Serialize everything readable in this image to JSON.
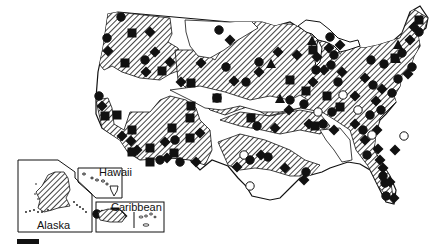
{
  "map": {
    "insets": {
      "alaska": {
        "label": "Alaska"
      },
      "hawaii": {
        "label": "Hawaii"
      },
      "caribbean": {
        "label": "Caribbean"
      }
    },
    "colors": {
      "ink": "#111111",
      "background": "#ffffff",
      "open_marker_fill": "#ffffff"
    },
    "hatch_pattern": "diagonal-lines",
    "marker_types": [
      "filled-circle",
      "filled-square",
      "filled-diamond",
      "filled-triangle",
      "open-circle"
    ],
    "markers": [
      {
        "t": "c",
        "x": 121,
        "y": 17
      },
      {
        "t": "s",
        "x": 132,
        "y": 33
      },
      {
        "t": "d",
        "x": 150,
        "y": 32
      },
      {
        "t": "c",
        "x": 107,
        "y": 38
      },
      {
        "t": "d",
        "x": 108,
        "y": 51
      },
      {
        "t": "d",
        "x": 155,
        "y": 52
      },
      {
        "t": "c",
        "x": 145,
        "y": 60
      },
      {
        "t": "s",
        "x": 125,
        "y": 63
      },
      {
        "t": "d",
        "x": 170,
        "y": 62
      },
      {
        "t": "s",
        "x": 162,
        "y": 71
      },
      {
        "t": "d",
        "x": 146,
        "y": 72
      },
      {
        "t": "d",
        "x": 201,
        "y": 63
      },
      {
        "t": "s",
        "x": 191,
        "y": 83
      },
      {
        "t": "d",
        "x": 181,
        "y": 82
      },
      {
        "t": "c",
        "x": 217,
        "y": 98
      },
      {
        "t": "s",
        "x": 217,
        "y": 98
      },
      {
        "t": "c",
        "x": 99,
        "y": 96
      },
      {
        "t": "d",
        "x": 102,
        "y": 106
      },
      {
        "t": "s",
        "x": 105,
        "y": 116
      },
      {
        "t": "s",
        "x": 117,
        "y": 115
      },
      {
        "t": "s",
        "x": 191,
        "y": 106
      },
      {
        "t": "s",
        "x": 190,
        "y": 118
      },
      {
        "t": "d",
        "x": 122,
        "y": 136
      },
      {
        "t": "s",
        "x": 132,
        "y": 130
      },
      {
        "t": "d",
        "x": 131,
        "y": 141
      },
      {
        "t": "s",
        "x": 132,
        "y": 152
      },
      {
        "t": "d",
        "x": 137,
        "y": 150
      },
      {
        "t": "s",
        "x": 150,
        "y": 148
      },
      {
        "t": "d",
        "x": 165,
        "y": 142
      },
      {
        "t": "s",
        "x": 172,
        "y": 128
      },
      {
        "t": "c",
        "x": 175,
        "y": 140
      },
      {
        "t": "d",
        "x": 167,
        "y": 158
      },
      {
        "t": "s",
        "x": 174,
        "y": 153
      },
      {
        "t": "c",
        "x": 180,
        "y": 162
      },
      {
        "t": "d",
        "x": 196,
        "y": 162
      },
      {
        "t": "d",
        "x": 200,
        "y": 133
      },
      {
        "t": "s",
        "x": 190,
        "y": 138
      },
      {
        "t": "s",
        "x": 150,
        "y": 162
      },
      {
        "t": "c",
        "x": 160,
        "y": 160
      },
      {
        "t": "c",
        "x": 226,
        "y": 67
      },
      {
        "t": "d",
        "x": 278,
        "y": 52
      },
      {
        "t": "d",
        "x": 297,
        "y": 55
      },
      {
        "t": "c",
        "x": 259,
        "y": 62
      },
      {
        "t": "tr",
        "x": 271,
        "y": 64
      },
      {
        "t": "d",
        "x": 259,
        "y": 72
      },
      {
        "t": "c",
        "x": 246,
        "y": 82
      },
      {
        "t": "d",
        "x": 234,
        "y": 81
      },
      {
        "t": "s",
        "x": 290,
        "y": 80
      },
      {
        "t": "d",
        "x": 313,
        "y": 82
      },
      {
        "t": "s",
        "x": 306,
        "y": 91
      },
      {
        "t": "s",
        "x": 327,
        "y": 96
      },
      {
        "t": "tr",
        "x": 280,
        "y": 99
      },
      {
        "t": "c",
        "x": 290,
        "y": 100
      },
      {
        "t": "d",
        "x": 289,
        "y": 110
      },
      {
        "t": "c",
        "x": 304,
        "y": 104
      },
      {
        "t": "tr",
        "x": 312,
        "y": 41
      },
      {
        "t": "s",
        "x": 313,
        "y": 50
      },
      {
        "t": "c",
        "x": 316,
        "y": 70
      },
      {
        "t": "d",
        "x": 317,
        "y": 57
      },
      {
        "t": "c",
        "x": 334,
        "y": 55
      },
      {
        "t": "c",
        "x": 331,
        "y": 65
      },
      {
        "t": "d",
        "x": 324,
        "y": 70
      },
      {
        "t": "d",
        "x": 342,
        "y": 72
      },
      {
        "t": "c",
        "x": 338,
        "y": 82
      },
      {
        "t": "o",
        "x": 343,
        "y": 95
      },
      {
        "t": "o",
        "x": 318,
        "y": 112
      },
      {
        "t": "c",
        "x": 332,
        "y": 112
      },
      {
        "t": "s",
        "x": 340,
        "y": 107
      },
      {
        "t": "d",
        "x": 355,
        "y": 96
      },
      {
        "t": "d",
        "x": 365,
        "y": 78
      },
      {
        "t": "c",
        "x": 373,
        "y": 85
      },
      {
        "t": "d",
        "x": 382,
        "y": 89
      },
      {
        "t": "c",
        "x": 392,
        "y": 93
      },
      {
        "t": "d",
        "x": 376,
        "y": 101
      },
      {
        "t": "c",
        "x": 371,
        "y": 60
      },
      {
        "t": "c",
        "x": 384,
        "y": 64
      },
      {
        "t": "s",
        "x": 395,
        "y": 58
      },
      {
        "t": "tr",
        "x": 398,
        "y": 45
      },
      {
        "t": "c",
        "x": 402,
        "y": 53
      },
      {
        "t": "d",
        "x": 408,
        "y": 74
      },
      {
        "t": "c",
        "x": 398,
        "y": 79
      },
      {
        "t": "tr",
        "x": 396,
        "y": 59
      },
      {
        "t": "c",
        "x": 412,
        "y": 67
      },
      {
        "t": "d",
        "x": 410,
        "y": 40
      },
      {
        "t": "c",
        "x": 419,
        "y": 32
      },
      {
        "t": "s",
        "x": 419,
        "y": 20
      },
      {
        "t": "d",
        "x": 414,
        "y": 27
      },
      {
        "t": "c",
        "x": 330,
        "y": 37
      },
      {
        "t": "d",
        "x": 340,
        "y": 45
      },
      {
        "t": "d",
        "x": 329,
        "y": 48
      },
      {
        "t": "o",
        "x": 358,
        "y": 110
      },
      {
        "t": "c",
        "x": 370,
        "y": 115
      },
      {
        "t": "d",
        "x": 355,
        "y": 124
      },
      {
        "t": "c",
        "x": 363,
        "y": 130
      },
      {
        "t": "d",
        "x": 365,
        "y": 140
      },
      {
        "t": "c",
        "x": 367,
        "y": 155
      },
      {
        "t": "d",
        "x": 377,
        "y": 130
      },
      {
        "t": "c",
        "x": 381,
        "y": 110
      },
      {
        "t": "o",
        "x": 372,
        "y": 135
      },
      {
        "t": "d",
        "x": 380,
        "y": 160
      },
      {
        "t": "c",
        "x": 383,
        "y": 176
      },
      {
        "t": "d",
        "x": 383,
        "y": 168
      },
      {
        "t": "c",
        "x": 385,
        "y": 183
      },
      {
        "t": "d",
        "x": 390,
        "y": 182
      },
      {
        "t": "c",
        "x": 386,
        "y": 196
      },
      {
        "t": "d",
        "x": 394,
        "y": 198
      },
      {
        "t": "o",
        "x": 404,
        "y": 136
      },
      {
        "t": "d",
        "x": 395,
        "y": 150
      },
      {
        "t": "d",
        "x": 378,
        "y": 149
      },
      {
        "t": "o",
        "x": 244,
        "y": 155
      },
      {
        "t": "c",
        "x": 250,
        "y": 160
      },
      {
        "t": "d",
        "x": 261,
        "y": 155
      },
      {
        "t": "c",
        "x": 268,
        "y": 157
      },
      {
        "t": "d",
        "x": 237,
        "y": 167
      },
      {
        "t": "d",
        "x": 285,
        "y": 168
      },
      {
        "t": "c",
        "x": 306,
        "y": 172
      },
      {
        "t": "o",
        "x": 250,
        "y": 186
      },
      {
        "t": "d",
        "x": 304,
        "y": 180
      },
      {
        "t": "s",
        "x": 251,
        "y": 118
      },
      {
        "t": "d",
        "x": 275,
        "y": 128
      },
      {
        "t": "c",
        "x": 257,
        "y": 126
      },
      {
        "t": "d",
        "x": 309,
        "y": 124
      },
      {
        "t": "s",
        "x": 315,
        "y": 126
      },
      {
        "t": "c",
        "x": 323,
        "y": 124
      },
      {
        "t": "d",
        "x": 334,
        "y": 130
      },
      {
        "t": "c",
        "x": 219,
        "y": 30
      },
      {
        "t": "d",
        "x": 230,
        "y": 40
      },
      {
        "t": "d",
        "x": 58,
        "y": 194
      },
      {
        "t": "d",
        "x": 102,
        "y": 215
      },
      {
        "t": "c",
        "x": 97,
        "y": 214
      },
      {
        "t": "d",
        "x": 122,
        "y": 216
      },
      {
        "t": "s",
        "x": 115,
        "y": 212
      }
    ]
  }
}
